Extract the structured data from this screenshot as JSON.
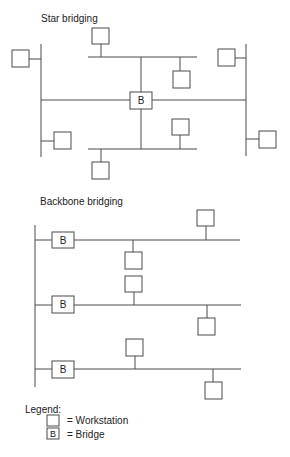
{
  "sections": {
    "star": {
      "title": "Star bridging"
    },
    "backbone": {
      "title": "Backbone bridging"
    }
  },
  "bridge_label": "B",
  "legend": {
    "title": "Legend:",
    "items": [
      {
        "icon": "workstation-icon",
        "label": "= Workstation"
      },
      {
        "icon": "bridge-icon",
        "glyph": "B",
        "label": "= Bridge"
      }
    ]
  },
  "colors": {
    "line": "#4a4a4a",
    "text": "#222222",
    "background": "#ffffff"
  }
}
